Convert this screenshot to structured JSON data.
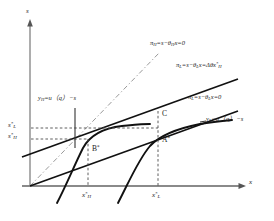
{
  "figure": {
    "kind": "economics-screening-diagram",
    "axes": {
      "y_label": "s",
      "x_label": "x",
      "origin": {
        "x": 30,
        "y": 186
      },
      "y_top": {
        "x": 30,
        "y": 22
      },
      "x_right": {
        "x": 246,
        "y": 186
      }
    },
    "colors": {
      "curve": "#111111",
      "axis": "#8a8a8a",
      "dashed": "#555555",
      "dashdot": "#888888",
      "text": "#1a1a1a",
      "background": "#ffffff"
    },
    "y_ticks": [
      {
        "id": "sL",
        "base": "s",
        "sub": "L",
        "star": "*",
        "y": 128
      },
      {
        "id": "sH",
        "base": "s",
        "sub": "H",
        "star": "*",
        "y": 139
      }
    ],
    "x_ticks": [
      {
        "id": "xH",
        "base": "x",
        "sub": "H",
        "star": "*",
        "x": 88
      },
      {
        "id": "xL",
        "base": "x",
        "sub": "L",
        "star": "*",
        "x": 158
      }
    ],
    "points": [
      {
        "id": "B",
        "label": "B",
        "star": "*",
        "x": 88,
        "y": 139,
        "label_x": 92,
        "label_y": 146
      },
      {
        "id": "C",
        "label": "C",
        "star": "",
        "x": 158,
        "y": 117,
        "label_x": 162,
        "label_y": 112
      },
      {
        "id": "A",
        "label": "A",
        "star": "*",
        "x": 158,
        "y": 134,
        "label_x": 162,
        "label_y": 139
      }
    ],
    "equations": [
      {
        "id": "pi-H-zero",
        "text": "πH=s−θHx=0",
        "parts": [
          {
            "t": "π",
            "style": "italic"
          },
          {
            "t": "H",
            "style": "sub"
          },
          {
            "t": "=s−",
            "style": "italic"
          },
          {
            "t": "θ",
            "style": "italic"
          },
          {
            "t": "H",
            "style": "sub"
          },
          {
            "t": "x=0",
            "style": "italic"
          }
        ],
        "x": 150,
        "y": 44,
        "line": "dash-dot"
      },
      {
        "id": "pi-L-delta",
        "text": "πL=s−θLx=Δθx*H",
        "x": 180,
        "y": 66,
        "line": "solid"
      },
      {
        "id": "pi-L-zero",
        "text": "πL=s−θLx=0",
        "x": 188,
        "y": 98,
        "line": "solid"
      },
      {
        "id": "y-H",
        "text": "yH=u（q）−s",
        "x": 38,
        "y": 99,
        "line": "solid-curve"
      },
      {
        "id": "y-L",
        "text": "yL=u（q）−s",
        "x": 206,
        "y": 120,
        "line": "solid-curve"
      }
    ]
  }
}
